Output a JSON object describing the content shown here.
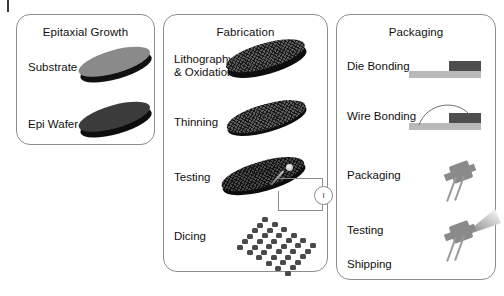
{
  "diagram": {
    "title_hidden": "",
    "corner_mark": "|",
    "panels": [
      {
        "id": "epitaxial-growth",
        "title": "Epitaxial Growth",
        "steps": [
          {
            "label": "Substrate",
            "graphic": "gray-wafer-disc"
          },
          {
            "label": "Epi Wafer",
            "graphic": "dark-wafer-disc"
          }
        ]
      },
      {
        "id": "fabrication",
        "title": "Fabrication",
        "steps": [
          {
            "label": "Lithography\n& Oxidation",
            "graphic": "textured-thick-wafer"
          },
          {
            "label": "Thinning",
            "graphic": "textured-thin-wafer"
          },
          {
            "label": "Testing",
            "graphic": "wafer-with-probe-and-current-meter"
          },
          {
            "label": "Dicing",
            "graphic": "die-array-grid"
          }
        ]
      },
      {
        "id": "packaging",
        "title": "Packaging",
        "steps": [
          {
            "label": "Die Bonding",
            "graphic": "substrate-bar-with-die"
          },
          {
            "label": "Wire Bonding",
            "graphic": "substrate-bar-with-die-and-wire-arc"
          },
          {
            "label": "Packaging",
            "graphic": "to-package-device"
          },
          {
            "label": "Testing",
            "graphic": "to-package-device-with-light-beam"
          },
          {
            "label": "Shipping",
            "graphic": "none"
          }
        ]
      }
    ],
    "annotations": {
      "current_meter_symbol": "I"
    },
    "colors": {
      "panel_border": "#8d8d8d",
      "substrate_wafer": "#8a8a8a",
      "epi_wafer": "#3b3b3b",
      "textured_wafer": "#5c5c5c",
      "die_array": "#4a4a4a",
      "package_substrate": "#b9b9b9",
      "package_die": "#4e4e4e",
      "device_body": "#8a8a8a",
      "text": "#111111",
      "background": "#ffffff"
    }
  }
}
